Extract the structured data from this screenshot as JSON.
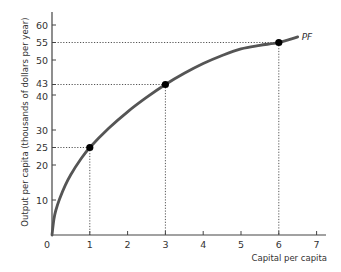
{
  "chart_data": {
    "type": "line",
    "title": "",
    "xlabel": "Capital per capita",
    "ylabel": "Output per capita (thousands of dollars per year)",
    "xlim": [
      0,
      7.2
    ],
    "ylim": [
      0,
      63
    ],
    "x_ticks": [
      0,
      1,
      2,
      3,
      4,
      5,
      6,
      7
    ],
    "x_tick_labels": [
      "0",
      "1",
      "2",
      "3",
      "4",
      "5",
      "6",
      "7"
    ],
    "y_ticks": [
      10,
      20,
      25,
      30,
      40,
      43,
      50,
      55,
      60
    ],
    "y_tick_labels": [
      "10",
      "20",
      "25",
      "30",
      "40",
      "43",
      "50",
      "55",
      "60"
    ],
    "grid": false,
    "series": [
      {
        "name": "PF",
        "x": [
          0,
          0.05,
          0.1,
          0.2,
          0.35,
          0.5,
          0.75,
          1,
          1.5,
          2,
          2.5,
          3,
          3.5,
          4,
          4.5,
          5,
          5.5,
          6,
          6.5
        ],
        "y": [
          0,
          4.5,
          7,
          10.3,
          14.2,
          17.3,
          21.5,
          25,
          30.5,
          35.2,
          39.3,
          43,
          46.2,
          49,
          51.3,
          53.2,
          54.2,
          55,
          56.6
        ]
      }
    ],
    "highlighted_points": [
      {
        "x": 1,
        "y": 25
      },
      {
        "x": 3,
        "y": 43
      },
      {
        "x": 6,
        "y": 55
      }
    ],
    "series_label": "PF",
    "colors": {
      "curve": "#555555",
      "axis": "#444444",
      "points": "#000000",
      "guides": "#555555"
    }
  }
}
